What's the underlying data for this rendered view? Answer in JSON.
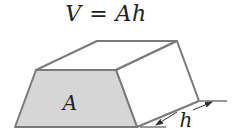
{
  "title": "V = Ah",
  "labels": {
    "base_area": "A",
    "height": "h"
  },
  "colors": {
    "edge": "#7a7a7a",
    "base_fill": "#d6d6d6",
    "text": "#222222"
  },
  "shape": "prism with trapezoidal base"
}
